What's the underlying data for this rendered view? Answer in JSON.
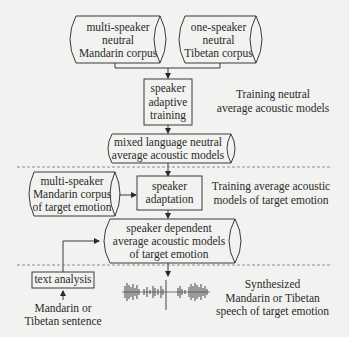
{
  "diagram": {
    "stage1": {
      "corpus_mandarin": [
        "multi-speaker",
        "neutral",
        "Mandarin corpus"
      ],
      "corpus_tibetan": [
        "one-speaker",
        "neutral",
        "Tibetan corpus"
      ],
      "process": [
        "speaker",
        "adaptive",
        "training"
      ],
      "description": [
        "Training neutral",
        "average acoustic models"
      ],
      "output": [
        "mixed language neutral",
        "average acoustic models"
      ]
    },
    "stage2": {
      "corpus_emotion": [
        "multi-speaker",
        "Mandarin corpus",
        "of target emotion"
      ],
      "process": [
        "speaker",
        "adaptation"
      ],
      "description": [
        "Training average acoustic",
        "models of target emotion"
      ],
      "output": [
        "speaker dependent",
        "average acoustic models",
        "of target emotion"
      ]
    },
    "stage3": {
      "process": "text analysis",
      "input": [
        "Mandarin or",
        "Tibetan sentence"
      ],
      "output_description": [
        "Synthesized",
        "Mandarin or Tibetan",
        "speech of target emotion"
      ],
      "waveform_icon": "speech-waveform-icon"
    },
    "colors": {
      "line": "#3a3a3a",
      "background": "#f2f2f0",
      "divider": "#777777"
    }
  }
}
